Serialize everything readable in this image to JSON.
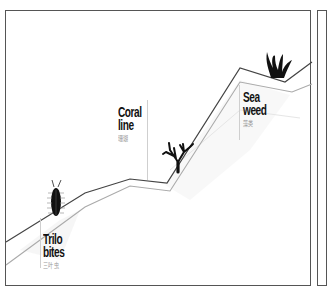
{
  "diagram": {
    "colors": {
      "frame": "#555555",
      "main_line": "#444444",
      "secondary_line": "#aaaaaa",
      "label_text": "#111111",
      "sub_text": "#999999",
      "icon_fill": "#111111"
    },
    "markers": [
      {
        "id": "trilobites",
        "title_line1": "Trilo",
        "title_line2": "bites",
        "subtitle": "三叶虫",
        "icon": "trilobite-icon"
      },
      {
        "id": "coral",
        "title_line1": "Coral",
        "title_line2": "line",
        "subtitle": "珊瑚",
        "icon": "coral-icon"
      },
      {
        "id": "seaweed",
        "title_line1": "Sea",
        "title_line2": "weed",
        "subtitle": "藻类",
        "icon": "seaweed-icon"
      }
    ]
  }
}
